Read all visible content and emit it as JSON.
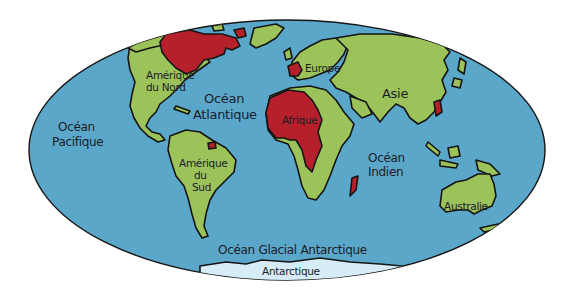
{
  "map": {
    "projection": "ellipse",
    "colors": {
      "ocean": "#5ba7c9",
      "land": "#9cc25a",
      "highlight": "#b5202a",
      "antarctica": "#d6ecf7",
      "outline": "#151515",
      "background": "#ffffff"
    },
    "labels": {
      "oceans": {
        "pacific_line1": "Océan",
        "pacific_line2": "Pacifique",
        "atlantic_line1": "Océan",
        "atlantic_line2": "Atlantique",
        "indian_line1": "Océan",
        "indian_line2": "Indien",
        "southern": "Océan Glacial Antarctique"
      },
      "continents": {
        "north_america_line1": "Amérique",
        "north_america_line2": "du Nord",
        "south_america_line1": "Amérique",
        "south_america_line2": "du",
        "south_america_line3": "Sud",
        "europe": "Europe",
        "africa": "Afrique",
        "asia": "Asie",
        "australia": "Australie",
        "antarctica": "Antarctique"
      }
    },
    "highlighted_regions": [
      "Canada (Québec)",
      "France",
      "Afrique de l'Ouest et centrale",
      "Madagascar",
      "Guyane",
      "Viêt Nam / Indochine"
    ]
  }
}
